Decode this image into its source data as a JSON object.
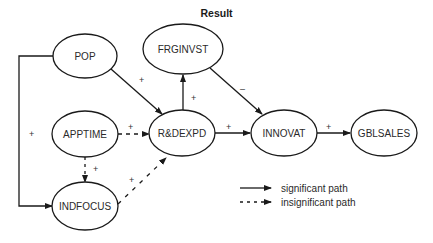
{
  "title": "Result",
  "colors": {
    "stroke": "#1a1a1a",
    "background": "#ffffff"
  },
  "nodes": [
    {
      "id": "POP",
      "label": "POP",
      "cx": 85,
      "cy": 56,
      "rx": 32,
      "ry": 22
    },
    {
      "id": "FRGINVST",
      "label": "FRGINVST",
      "cx": 183,
      "cy": 49,
      "rx": 40,
      "ry": 25
    },
    {
      "id": "APPTIME",
      "label": "APPTIME",
      "cx": 85,
      "cy": 134,
      "rx": 33,
      "ry": 23
    },
    {
      "id": "RDEXPD",
      "label": "R&DEXPD",
      "cx": 182,
      "cy": 133,
      "rx": 33,
      "ry": 23
    },
    {
      "id": "INNOVAT",
      "label": "INNOVAT",
      "cx": 284,
      "cy": 133,
      "rx": 33,
      "ry": 23
    },
    {
      "id": "GBLSALES",
      "label": "GBLSALES",
      "cx": 384,
      "cy": 133,
      "rx": 33,
      "ry": 23
    },
    {
      "id": "INDFOCUS",
      "label": "INDFOCUS",
      "cx": 85,
      "cy": 206,
      "rx": 33,
      "ry": 24
    }
  ],
  "edges": [
    {
      "from": "POP",
      "to": "RDEXPD",
      "sign": "+",
      "significant": true
    },
    {
      "from": "RDEXPD",
      "to": "FRGINVST",
      "sign": "+",
      "significant": true
    },
    {
      "from": "FRGINVST",
      "to": "INNOVAT",
      "sign": "–",
      "significant": true
    },
    {
      "from": "APPTIME",
      "to": "RDEXPD",
      "sign": "+",
      "significant": false
    },
    {
      "from": "RDEXPD",
      "to": "INNOVAT",
      "sign": "+",
      "significant": true
    },
    {
      "from": "INNOVAT",
      "to": "GBLSALES",
      "sign": "+",
      "significant": true
    },
    {
      "from": "APPTIME",
      "to": "INDFOCUS",
      "sign": "+",
      "significant": false
    },
    {
      "from": "INDFOCUS",
      "to": "RDEXPD",
      "sign": "+",
      "significant": false
    },
    {
      "from": "POP",
      "to": "INDFOCUS",
      "sign": "+",
      "significant": true
    }
  ],
  "labels": {
    "edge_pop_rd": "+",
    "edge_rd_frg": "+",
    "edge_frg_inn": "–",
    "edge_app_rd": "+",
    "edge_rd_inn": "+",
    "edge_inn_gbl": "+",
    "edge_app_ind": "+",
    "edge_ind_rd": "+",
    "edge_pop_ind": "+"
  },
  "legend": {
    "significant": "significant path",
    "insignificant": "insignificant path"
  }
}
